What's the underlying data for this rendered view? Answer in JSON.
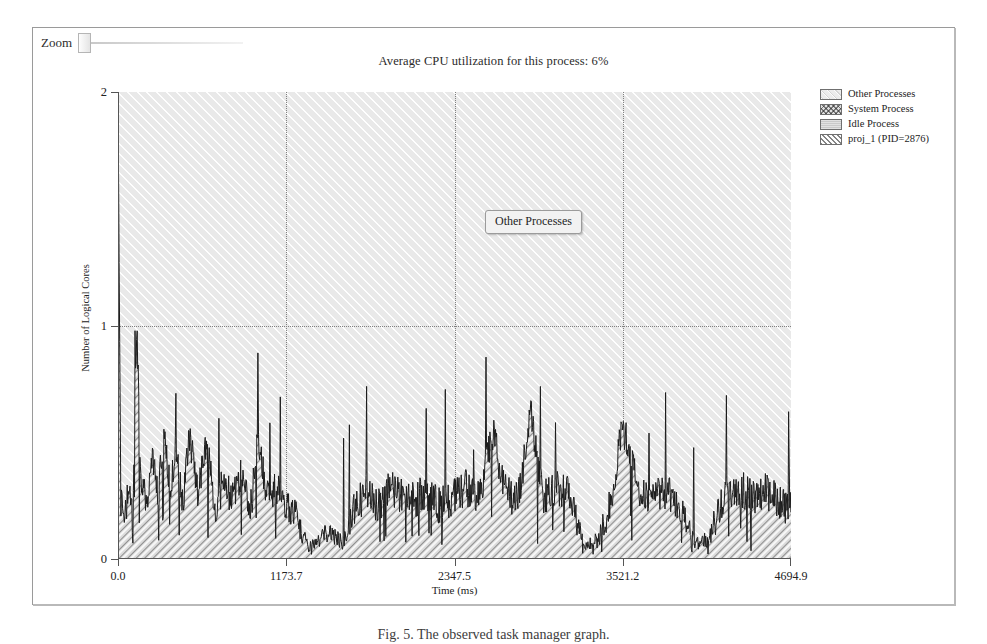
{
  "window": {
    "zoom_label": "Zoom",
    "zoom_value": "0"
  },
  "chart_data": {
    "type": "area",
    "title": "Average CPU utilization for this process: 6%",
    "xlabel": "Time (ms)",
    "ylabel": "Number of Logical Cores",
    "xlim": [
      0.0,
      4694.9
    ],
    "ylim": [
      0,
      2
    ],
    "grid": true,
    "legend_position": "right",
    "xticks": [
      "0.0",
      "1173.7",
      "2347.5",
      "3521.2",
      "4694.9"
    ],
    "xtick_values": [
      0.0,
      1173.7,
      2347.5,
      3521.2,
      4694.9
    ],
    "yticks": [
      "0",
      "1",
      "2"
    ],
    "ytick_values": [
      0,
      1,
      2
    ],
    "series": [
      {
        "name": "Other Processes",
        "fill": "light-diagonal-hatch",
        "note": "Stacked top band filling remainder up to 2 logical cores"
      },
      {
        "name": "System Process",
        "fill": "cross-hatch",
        "note": "Thin band, nearly invisible at this scale"
      },
      {
        "name": "Idle Process",
        "fill": "solid-gray",
        "note": "Thin band, nearly invisible at this scale"
      },
      {
        "name": "proj_1 (PID=2876)",
        "fill": "dense-diagonal-hatch",
        "note": "Lower spiky band; averages ~0.12 cores with bursts to 1.0 and an initial spike near 1.95",
        "x": [
          0,
          20,
          40,
          60,
          80,
          100,
          130,
          160,
          200,
          240,
          280,
          320,
          360,
          400,
          450,
          500,
          560,
          620,
          680,
          740,
          800,
          860,
          920,
          980,
          1040,
          1100,
          1173,
          1250,
          1330,
          1410,
          1490,
          1570,
          1650,
          1730,
          1820,
          1900,
          1980,
          2060,
          2150,
          2240,
          2347,
          2430,
          2520,
          2610,
          2700,
          2790,
          2880,
          2970,
          3060,
          3150,
          3250,
          3350,
          3450,
          3521,
          3620,
          3720,
          3820,
          3920,
          4020,
          4120,
          4220,
          4320,
          4420,
          4520,
          4620,
          4694
        ],
        "y": [
          1.95,
          0.25,
          0.18,
          0.22,
          0.3,
          0.15,
          0.98,
          0.35,
          0.22,
          0.4,
          0.26,
          0.55,
          0.3,
          0.45,
          0.22,
          0.52,
          0.28,
          0.48,
          0.2,
          0.33,
          0.24,
          0.36,
          0.18,
          0.52,
          0.26,
          0.3,
          0.22,
          0.16,
          0.05,
          0.08,
          0.12,
          0.06,
          0.2,
          0.28,
          0.22,
          0.3,
          0.26,
          0.24,
          0.28,
          0.22,
          0.26,
          0.3,
          0.24,
          0.55,
          0.28,
          0.24,
          0.62,
          0.26,
          0.3,
          0.28,
          0.05,
          0.08,
          0.26,
          0.57,
          0.3,
          0.26,
          0.28,
          0.22,
          0.06,
          0.08,
          0.24,
          0.3,
          0.26,
          0.28,
          0.24,
          0.2
        ]
      }
    ]
  },
  "tooltip": {
    "text": "Other Processes"
  },
  "legend": {
    "items": [
      {
        "label": "Other Processes"
      },
      {
        "label": "System Process"
      },
      {
        "label": "Idle Process"
      },
      {
        "label": "proj_1 (PID=2876)"
      }
    ]
  },
  "caption": {
    "text": "Fig. 5. The observed task manager graph."
  }
}
